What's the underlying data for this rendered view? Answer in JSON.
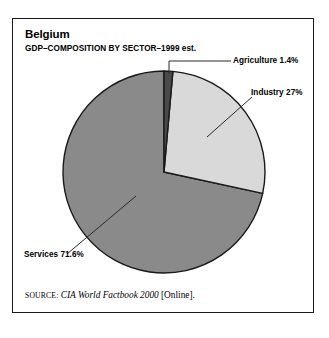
{
  "figure": {
    "title": "Belgium",
    "subtitle": "GDP–COMPOSITION BY SECTOR–1999 est."
  },
  "labels": {
    "agriculture": "Agriculture 1.4%",
    "industry": "Industry 27%",
    "services": "Services 71.6%"
  },
  "source": {
    "label": "Source:",
    "work": "CIA World Factbook 2000",
    "medium": "[Online]."
  },
  "colors": {
    "agriculture": "#4a4a4a",
    "industry": "#d9d9d9",
    "services": "#8a8a8a",
    "outline": "#1a1a1a",
    "frame": "#1a1a1a",
    "leader": "#2a2a2a",
    "background": "#ffffff"
  },
  "chart_data": {
    "type": "pie",
    "title": "Belgium",
    "subtitle": "GDP–COMPOSITION BY SECTOR–1999 est.",
    "categories": [
      "Agriculture",
      "Industry",
      "Services"
    ],
    "values": [
      1.4,
      27.0,
      71.6
    ],
    "unit": "percent",
    "value_labels": [
      "1.4%",
      "27%",
      "71.6%"
    ],
    "slice_colors": [
      "#4a4a4a",
      "#d9d9d9",
      "#8a8a8a"
    ],
    "start_angle_deg": 0,
    "direction": "clockwise",
    "legend": "none",
    "labels_position": "outside-with-leader-lines",
    "annotations": [
      "Agriculture 1.4%",
      "Industry 27%",
      "Services 71.6%"
    ],
    "source": "CIA World Factbook 2000 [Online]."
  },
  "geometry": {
    "center_x": 164,
    "center_y": 172,
    "radius": 101
  }
}
